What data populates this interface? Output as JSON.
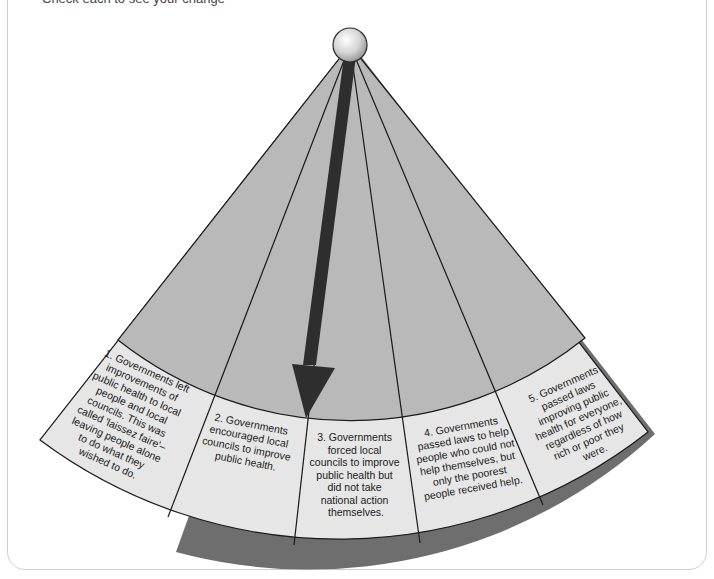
{
  "header": {
    "instruction_partial": "Check each to see your change"
  },
  "diagram": {
    "type": "spectrum-fan-pointer",
    "pointer_position": 3,
    "colors": {
      "fan_upper": "#b9b9b9",
      "fan_label_area": "#e6e6e6",
      "outline": "#1a1a1a",
      "shadow": "#6e6e6e",
      "arrow": "#2e2e2e",
      "pivot": "#d8d8d8"
    },
    "segments": [
      {
        "number": "1",
        "lines": [
          "1. Governments left",
          "improvements of",
          "public health to local",
          "people and local",
          "councils. This was",
          "called 'laissez faire'–",
          "leaving people alone",
          "to do what they",
          "wished to do."
        ]
      },
      {
        "number": "2",
        "lines": [
          "2. Governments",
          "encouraged local",
          "councils to improve",
          "public health."
        ]
      },
      {
        "number": "3",
        "lines": [
          "3. Governments",
          "forced local",
          "councils to improve",
          "public health but",
          "did not take",
          "national action",
          "themselves."
        ]
      },
      {
        "number": "4",
        "lines": [
          "4. Governments",
          "passed laws to help",
          "people who could not",
          "help themselves, but",
          "only the poorest",
          "people received help."
        ]
      },
      {
        "number": "5",
        "lines": [
          "5. Governments",
          "passed laws",
          "improving public",
          "health for everyone,",
          "regardless of how",
          "rich or poor they",
          "were."
        ]
      }
    ]
  }
}
